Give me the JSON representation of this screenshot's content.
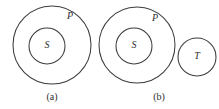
{
  "figure": {
    "background_color": "#ffffff",
    "stroke_color": "#3c3c3c",
    "text_color": "#2e2e2e",
    "panels": [
      {
        "caption": "(a)",
        "caption_x": 52,
        "caption_y": 98,
        "shapes": [
          {
            "name": "outer-set-circle",
            "label": "P",
            "cx": 52,
            "cy": 45,
            "r": 39,
            "label_x": 70,
            "label_y": 17
          },
          {
            "name": "inner-set-circle",
            "label": "S",
            "cx": 47,
            "cy": 46,
            "r": 18,
            "label_x": 47,
            "label_y": 46
          }
        ]
      },
      {
        "caption": "(b)",
        "caption_x": 159,
        "caption_y": 98,
        "shapes": [
          {
            "name": "outer-set-circle",
            "label": "P",
            "cx": 137,
            "cy": 45,
            "r": 38,
            "label_x": 155,
            "label_y": 19
          },
          {
            "name": "inner-set-circle",
            "label": "S",
            "cx": 134,
            "cy": 46,
            "r": 18,
            "label_x": 134,
            "label_y": 46
          },
          {
            "name": "disjoint-set-circle",
            "label": "T",
            "cx": 197,
            "cy": 57,
            "r": 19,
            "label_x": 197,
            "label_y": 57
          }
        ]
      }
    ]
  }
}
